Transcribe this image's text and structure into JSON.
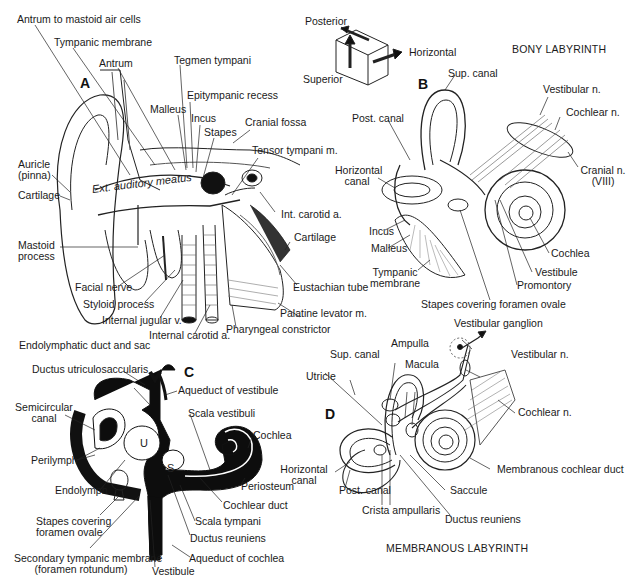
{
  "figure": {
    "panels": {
      "A": "A",
      "B": "B",
      "C": "C",
      "D": "D"
    },
    "orientation_key": {
      "posterior": "Posterior",
      "horizontal": "Horizontal",
      "superior": "Superior"
    },
    "titles": {
      "bony": "BONY LABYRINTH",
      "membranous": "MEMBRANOUS LABYRINTH"
    },
    "panel_a": {
      "labels": {
        "antrum_mastoid": "Antrum to mastoid air cells",
        "tympanic_membrane": "Tympanic membrane",
        "antrum": "Antrum",
        "tegmen_tympani": "Tegmen tympani",
        "epitympanic_recess": "Epitympanic recess",
        "malleus": "Malleus",
        "incus": "Incus",
        "stapes": "Stapes",
        "cranial_fossa": "Cranial fossa",
        "tensor_tympani": "Tensor tympani m.",
        "auricle_1": "Auricle",
        "auricle_2": "(pinna)",
        "cartilage_left": "Cartilage",
        "ext_auditory_meatus": "Ext. auditory meatus",
        "int_carotid_upper": "Int. carotid a.",
        "mastoid_1": "Mastoid",
        "mastoid_2": "process",
        "cartilage_right": "Cartilage",
        "facial_nerve": "Facial nerve",
        "eustachian_tube": "Eustachian tube",
        "styloid_process": "Styloid process",
        "palatine_levator": "Palatine levator m.",
        "internal_jugular": "Internal jugular v.",
        "pharyngeal_constrictor": "Pharyngeal constrictor",
        "internal_carotid": "Internal carotid a."
      }
    },
    "panel_b": {
      "labels": {
        "sup_canal": "Sup. canal",
        "vestibular_n": "Vestibular n.",
        "cochlear_n": "Cochlear n.",
        "post_canal": "Post. canal",
        "horizontal_canal_1": "Horizontal",
        "horizontal_canal_2": "canal",
        "cranial_n_1": "Cranial n.",
        "cranial_n_2": "(VIII)",
        "incus": "Incus",
        "malleus": "Malleus",
        "cochlea": "Cochlea",
        "vestibule": "Vestibule",
        "tympanic_membrane_1": "Tympanic",
        "tympanic_membrane_2": "membrane",
        "promontory": "Promontory",
        "stapes_foramen": "Stapes covering foramen ovale"
      }
    },
    "panel_c": {
      "labels": {
        "endolymphatic_duct": "Endolymphatic duct and sac",
        "ductus_utriculosaccularis": "Ductus utriculosaccularis",
        "aqueduct_vestibule": "Aqueduct of vestibule",
        "semicircular_1": "Semicircular",
        "semicircular_2": "canal",
        "scala_vestibuli": "Scala vestibuli",
        "cochlea": "Cochlea",
        "perilymph": "Perilymph",
        "endolymph": "Endolymph",
        "periosteum": "Periosteum",
        "cochlear_duct": "Cochlear duct",
        "stapes_1": "Stapes covering",
        "stapes_2": "foramen ovale",
        "scala_tympani": "Scala tympani",
        "ductus_reuniens": "Ductus reuniens",
        "secondary_tympanic_1": "Secondary tympanic membrane",
        "secondary_tympanic_2": "(foramen rotundum)",
        "aqueduct_cochlea": "Aqueduct of cochlea",
        "vestibule": "Vestibule",
        "utricle_letter": "U",
        "saccule_letter": "S"
      }
    },
    "panel_d": {
      "labels": {
        "vestibular_ganglion": "Vestibular ganglion",
        "ampulla": "Ampulla",
        "sup_canal": "Sup. canal",
        "vestibular_n": "Vestibular n.",
        "macula": "Macula",
        "utricle": "Utricle",
        "cochlear_n": "Cochlear n.",
        "horizontal_canal_1": "Horizontal",
        "horizontal_canal_2": "canal",
        "membranous_cochlear_duct": "Membranous cochlear duct",
        "post_canal": "Post. canal",
        "saccule": "Saccule",
        "crista_ampullaris": "Crista ampullaris",
        "ductus_reuniens": "Ductus reuniens"
      }
    }
  }
}
